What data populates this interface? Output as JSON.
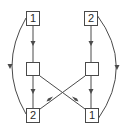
{
  "diagram": {
    "colors": {
      "stroke": "#4a4a4a",
      "text": "#2a2a2a",
      "background": "#ffffff"
    },
    "nodes": {
      "top_left": {
        "label": "1"
      },
      "top_right": {
        "label": "2"
      },
      "mid_left": {
        "label": ""
      },
      "mid_right": {
        "label": ""
      },
      "bottom_left": {
        "label": "2"
      },
      "bottom_right": {
        "label": "1"
      }
    },
    "edges": [
      {
        "from": "top_left",
        "to": "mid_left",
        "type": "straight"
      },
      {
        "from": "top_right",
        "to": "mid_right",
        "type": "straight"
      },
      {
        "from": "mid_left",
        "to": "bottom_left",
        "type": "straight"
      },
      {
        "from": "mid_right",
        "to": "bottom_right",
        "type": "straight"
      },
      {
        "from": "mid_left",
        "to": "bottom_right",
        "type": "diagonal-cross"
      },
      {
        "from": "mid_right",
        "to": "bottom_left",
        "type": "diagonal-cross"
      },
      {
        "from": "top_left",
        "to": "bottom_left",
        "type": "arc-left"
      },
      {
        "from": "top_right",
        "to": "bottom_right",
        "type": "arc-right"
      }
    ]
  }
}
